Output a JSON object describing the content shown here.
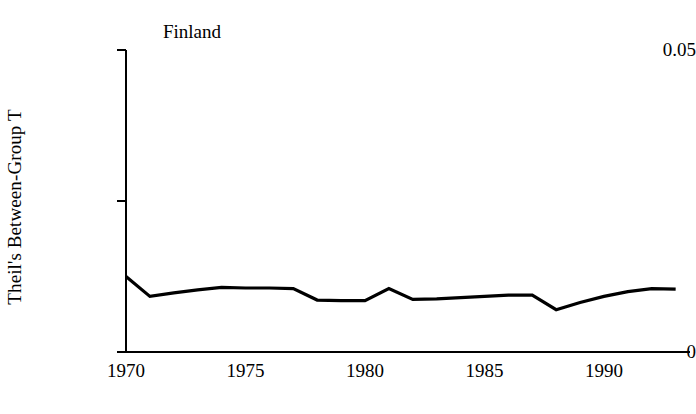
{
  "chart_data": {
    "type": "line",
    "title": "Finland",
    "xlabel": "",
    "ylabel": "Theil's Between-Group T",
    "xlim": [
      1970,
      1993.6
    ],
    "ylim": [
      0,
      0.05
    ],
    "grid": false,
    "legend": false,
    "legend_position": "none",
    "x_tick_labels": [
      "1970",
      "1975",
      "1980",
      "1985",
      "1990"
    ],
    "x_tick_values": [
      1970,
      1975,
      1980,
      1985,
      1990
    ],
    "y_tick_labels": [
      "0.05",
      "",
      "0"
    ],
    "y_tick_values": [
      0.05,
      0.025,
      0
    ],
    "series": [
      {
        "name": "Finland",
        "color": "#000000",
        "x": [
          1970,
          1971,
          1972,
          1973,
          1974,
          1975,
          1976,
          1977,
          1978,
          1979,
          1980,
          1981,
          1982,
          1983,
          1984,
          1985,
          1986,
          1987,
          1988,
          1989,
          1990,
          1991,
          1992,
          1993
        ],
        "values": [
          0.0125,
          0.0092,
          0.0098,
          0.0103,
          0.0107,
          0.0106,
          0.0106,
          0.0105,
          0.0086,
          0.0085,
          0.0085,
          0.0105,
          0.0087,
          0.0088,
          0.009,
          0.0092,
          0.0094,
          0.0094,
          0.007,
          0.0082,
          0.0092,
          0.01,
          0.0105,
          0.0104
        ]
      }
    ]
  },
  "axes": {
    "y_top_label": "0.05",
    "y_zero_label": "0",
    "y_axis_title": "Theil's Between-Group T",
    "x_labels": [
      "1970",
      "1975",
      "1980",
      "1985",
      "1990"
    ]
  },
  "colors": {
    "series": "#000000",
    "axis": "#000000",
    "background": "#ffffff"
  }
}
